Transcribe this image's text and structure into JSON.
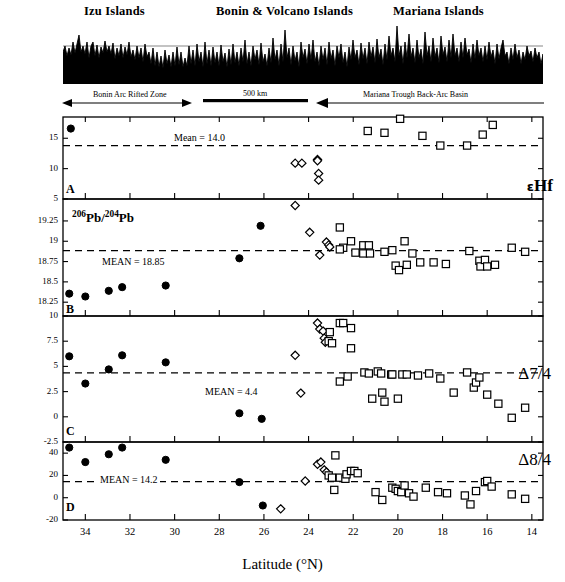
{
  "figure": {
    "title_profile": "Bathymetric profile of the Izu-Bonin-Mariana arc system",
    "axis_title_x": "Latitude (°N)",
    "xlim": [
      35.0,
      13.5
    ],
    "xticks": [
      34,
      32,
      30,
      28,
      26,
      24,
      22,
      20,
      18,
      16,
      14
    ],
    "xtick_labels": [
      "34",
      "32",
      "30",
      "28",
      "26",
      "24",
      "22",
      "20",
      "18",
      "16",
      "14"
    ]
  },
  "profile": {
    "region_labels": [
      {
        "text": "Izu Islands",
        "x_frac": 0.255
      },
      {
        "text": "Bonin & Volcano Islands",
        "x_frac": 0.545
      },
      {
        "text": "Mariana Islands",
        "x_frac": 0.825
      }
    ],
    "annotations": [
      {
        "text": "Bonin Arc Rifted Zone",
        "name": "bonin-arc-rifted-zone-label"
      },
      {
        "text": "500 km",
        "name": "scale-bar-label"
      },
      {
        "text": "Mariana Trough Back-Arc Basin",
        "name": "mariana-trough-label"
      }
    ]
  },
  "legend": {
    "series": [
      {
        "name": "izu-filled-circle",
        "symbol": "filled-circle",
        "label": "Izu"
      },
      {
        "name": "bonin-open-diamond",
        "symbol": "open-diamond",
        "label": "Bonin"
      },
      {
        "name": "mariana-open-square",
        "symbol": "open-square",
        "label": "Mariana"
      }
    ]
  },
  "chart_data": [
    {
      "panel": "A",
      "type": "scatter",
      "ylabel": "εHf",
      "ylabel_plain": "epsilon-Hf",
      "xlabel": "Latitude (°N)",
      "ylim": [
        5,
        18.5
      ],
      "yticks": [
        5,
        10,
        15
      ],
      "ytick_labels": [
        "5",
        "10",
        "15"
      ],
      "mean_value": 13.8,
      "mean_label": "Mean = 14.0",
      "grid": false,
      "series": [
        {
          "name": "filled-circle",
          "points": [
            [
              34.65,
              16.6
            ]
          ]
        },
        {
          "name": "open-diamond",
          "points": [
            [
              24.6,
              10.9
            ],
            [
              24.3,
              10.9
            ],
            [
              23.6,
              11.5
            ],
            [
              23.6,
              11.3
            ],
            [
              23.55,
              9.2
            ],
            [
              23.55,
              8.1
            ]
          ]
        },
        {
          "name": "open-square",
          "points": [
            [
              21.35,
              16.2
            ],
            [
              20.6,
              15.9
            ],
            [
              19.9,
              18.2
            ],
            [
              18.9,
              15.4
            ],
            [
              18.1,
              13.8
            ],
            [
              16.9,
              13.8
            ],
            [
              16.2,
              15.6
            ],
            [
              15.75,
              17.2
            ]
          ]
        }
      ]
    },
    {
      "panel": "B",
      "type": "scatter",
      "ylabel": "206Pb/204Pb",
      "ylabel_html": "<sup>206</sup>Pb/<sup>204</sup>Pb",
      "xlabel": "Latitude (°N)",
      "ylim": [
        18.08,
        19.52
      ],
      "yticks": [
        18.25,
        18.5,
        18.75,
        19,
        19.25
      ],
      "ytick_labels": [
        "18.25",
        "18.5",
        "18.75",
        "19",
        "19.25"
      ],
      "mean_value": 18.885,
      "mean_label": "MEAN = 18.85",
      "grid": false,
      "series": [
        {
          "name": "filled-circle",
          "points": [
            [
              34.72,
              18.355
            ],
            [
              34.0,
              18.32
            ],
            [
              32.95,
              18.39
            ],
            [
              32.35,
              18.435
            ],
            [
              30.4,
              18.455
            ],
            [
              26.15,
              19.19
            ],
            [
              27.1,
              18.79
            ]
          ]
        },
        {
          "name": "open-diamond",
          "points": [
            [
              24.6,
              19.44
            ],
            [
              23.95,
              19.11
            ],
            [
              23.2,
              18.99
            ],
            [
              23.1,
              18.955
            ],
            [
              23.05,
              18.93
            ],
            [
              23.5,
              18.83
            ]
          ]
        },
        {
          "name": "open-square",
          "points": [
            [
              22.6,
              19.17
            ],
            [
              22.45,
              18.92
            ],
            [
              22.6,
              18.9
            ],
            [
              22.1,
              19.0
            ],
            [
              21.55,
              18.95
            ],
            [
              21.3,
              18.95
            ],
            [
              21.9,
              18.86
            ],
            [
              21.55,
              18.85
            ],
            [
              21.25,
              18.85
            ],
            [
              20.6,
              18.87
            ],
            [
              20.25,
              18.89
            ],
            [
              20.1,
              18.7
            ],
            [
              19.95,
              18.645
            ],
            [
              19.6,
              18.71
            ],
            [
              19.7,
              19.0
            ],
            [
              19.35,
              18.85
            ],
            [
              19.0,
              18.74
            ],
            [
              18.4,
              18.74
            ],
            [
              17.85,
              18.72
            ],
            [
              16.8,
              18.88
            ],
            [
              16.35,
              18.76
            ],
            [
              16.3,
              18.69
            ],
            [
              16.1,
              18.77
            ],
            [
              16.0,
              18.69
            ],
            [
              15.65,
              18.71
            ],
            [
              14.9,
              18.92
            ],
            [
              14.3,
              18.87
            ]
          ]
        }
      ]
    },
    {
      "panel": "C",
      "type": "scatter",
      "ylabel": "Δ7/4",
      "ylabel_plain": "Delta 7/4",
      "xlabel": "Latitude (°N)",
      "ylim": [
        -2.5,
        10
      ],
      "yticks": [
        -2.5,
        0,
        2.5,
        5,
        7.5,
        10
      ],
      "ytick_labels": [
        "-2.5",
        "0",
        "2.5",
        "5",
        "7.5",
        "10"
      ],
      "mean_value": 4.35,
      "mean_label": "MEAN = 4.4",
      "grid": false,
      "series": [
        {
          "name": "filled-circle",
          "points": [
            [
              34.72,
              6.0
            ],
            [
              34.0,
              3.3
            ],
            [
              32.95,
              4.7
            ],
            [
              32.35,
              6.1
            ],
            [
              30.4,
              5.4
            ],
            [
              27.1,
              0.35
            ],
            [
              26.1,
              -0.2
            ]
          ]
        },
        {
          "name": "open-diamond",
          "points": [
            [
              24.6,
              6.1
            ],
            [
              24.35,
              2.35
            ],
            [
              23.6,
              9.3
            ],
            [
              23.5,
              8.7
            ],
            [
              23.35,
              8.5
            ],
            [
              23.3,
              7.8
            ],
            [
              23.25,
              7.4
            ]
          ]
        },
        {
          "name": "open-square",
          "points": [
            [
              23.1,
              7.5
            ],
            [
              23.05,
              8.4
            ],
            [
              22.95,
              7.3
            ],
            [
              22.6,
              9.3
            ],
            [
              22.45,
              9.3
            ],
            [
              22.1,
              8.8
            ],
            [
              22.1,
              6.8
            ],
            [
              22.6,
              3.5
            ],
            [
              22.25,
              4.0
            ],
            [
              21.5,
              4.4
            ],
            [
              21.3,
              4.3
            ],
            [
              21.15,
              1.8
            ],
            [
              20.9,
              4.5
            ],
            [
              20.75,
              4.3
            ],
            [
              20.7,
              2.4
            ],
            [
              20.6,
              1.5
            ],
            [
              20.3,
              4.2
            ],
            [
              20.25,
              4.2
            ],
            [
              20.0,
              1.8
            ],
            [
              19.8,
              4.2
            ],
            [
              19.6,
              4.2
            ],
            [
              19.1,
              4.1
            ],
            [
              18.6,
              4.3
            ],
            [
              18.1,
              3.8
            ],
            [
              17.5,
              2.4
            ],
            [
              16.9,
              4.4
            ],
            [
              16.6,
              2.9
            ],
            [
              16.5,
              3.4
            ],
            [
              16.35,
              3.9
            ],
            [
              16.0,
              2.2
            ],
            [
              15.5,
              1.3
            ],
            [
              14.9,
              -0.1
            ],
            [
              14.3,
              0.9
            ]
          ]
        }
      ]
    },
    {
      "panel": "D",
      "type": "scatter",
      "ylabel": "Δ8/4",
      "ylabel_plain": "Delta 8/4",
      "xlabel": "Latitude (°N)",
      "ylim": [
        -20,
        50
      ],
      "yticks": [
        -20,
        0,
        20,
        40
      ],
      "ytick_labels": [
        "-20",
        "0",
        "20",
        "40"
      ],
      "mean_value": 14.5,
      "mean_label": "MEAN = 14.2",
      "grid": false,
      "series": [
        {
          "name": "filled-circle",
          "points": [
            [
              34.72,
              45
            ],
            [
              34.0,
              32
            ],
            [
              32.95,
              39
            ],
            [
              32.35,
              45
            ],
            [
              30.4,
              34
            ],
            [
              27.1,
              14
            ],
            [
              26.05,
              -7
            ]
          ]
        },
        {
          "name": "open-diamond",
          "points": [
            [
              24.15,
              15
            ],
            [
              25.25,
              -10
            ],
            [
              23.6,
              30
            ],
            [
              23.45,
              32
            ],
            [
              23.3,
              25
            ],
            [
              23.2,
              23
            ]
          ]
        },
        {
          "name": "open-square",
          "points": [
            [
              23.1,
              20
            ],
            [
              22.95,
              18
            ],
            [
              22.8,
              38
            ],
            [
              22.6,
              18
            ],
            [
              22.35,
              17
            ],
            [
              22.3,
              21
            ],
            [
              22.1,
              24
            ],
            [
              21.95,
              24
            ],
            [
              21.8,
              22
            ],
            [
              22.85,
              7
            ],
            [
              21.0,
              5
            ],
            [
              20.7,
              -2
            ],
            [
              20.25,
              9
            ],
            [
              20.1,
              8
            ],
            [
              20.0,
              6
            ],
            [
              19.85,
              5
            ],
            [
              19.7,
              11
            ],
            [
              19.5,
              4
            ],
            [
              19.3,
              1
            ],
            [
              18.75,
              9
            ],
            [
              18.2,
              5
            ],
            [
              17.8,
              4
            ],
            [
              17.0,
              2
            ],
            [
              16.75,
              -6
            ],
            [
              16.5,
              6
            ],
            [
              16.1,
              14
            ],
            [
              16.0,
              15
            ],
            [
              15.8,
              10
            ],
            [
              14.9,
              3
            ],
            [
              14.3,
              -1
            ]
          ]
        }
      ]
    }
  ]
}
